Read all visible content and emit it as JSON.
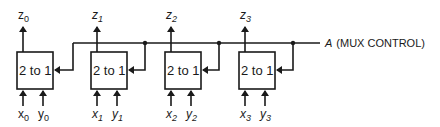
{
  "diagram": {
    "type": "quad 2-to-1 multiplexer",
    "control": {
      "signal": "A",
      "label": "(MUX CONTROL)"
    },
    "muxes": [
      {
        "label": "2 to 1",
        "output": {
          "name": "z",
          "sub": "0"
        },
        "inputs": [
          {
            "name": "x",
            "sub": "0"
          },
          {
            "name": "y",
            "sub": "0"
          }
        ]
      },
      {
        "label": "2 to 1",
        "output": {
          "name": "z",
          "sub": "1"
        },
        "inputs": [
          {
            "name": "x",
            "sub": "1"
          },
          {
            "name": "y",
            "sub": "1"
          }
        ]
      },
      {
        "label": "2 to 1",
        "output": {
          "name": "z",
          "sub": "2"
        },
        "inputs": [
          {
            "name": "x",
            "sub": "2"
          },
          {
            "name": "y",
            "sub": "2"
          }
        ]
      },
      {
        "label": "2 to 1",
        "output": {
          "name": "z",
          "sub": "3"
        },
        "inputs": [
          {
            "name": "x",
            "sub": "3"
          },
          {
            "name": "y",
            "sub": "3"
          }
        ]
      }
    ],
    "colors": {
      "line": "#1a1a1a",
      "background": "#ffffff"
    }
  }
}
